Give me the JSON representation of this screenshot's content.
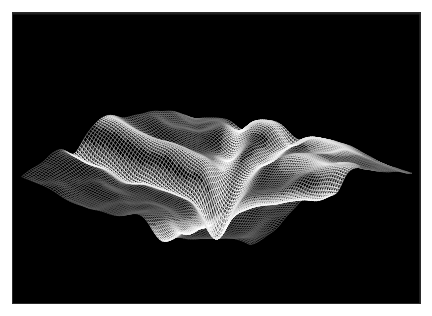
{
  "figure": {
    "type": "wireframe-surface-plot",
    "title": "",
    "background_color": "#000000",
    "page_color": "#ffffff",
    "line_color": "#d8d8d8",
    "border_width_px": 13,
    "plot_width_px": 407,
    "plot_height_px": 290
  },
  "chart_data": {
    "type": "surface",
    "render_style": "wireframe-mesh",
    "title": "",
    "subtitle": "",
    "xlabel": "",
    "ylabel": "",
    "zlabel": "",
    "grid": false,
    "legend": false,
    "axes_visible": false,
    "tick_labels": [],
    "annotations": [],
    "colors": {
      "background": "#000000",
      "wire_low": "#8d8d8d",
      "wire_high": "#f2f2f2",
      "wire_shadow": "#2f2f2f"
    },
    "projection": {
      "kind": "isometric-oblique",
      "azimuth_deg": 40,
      "elevation_deg": 26,
      "z_scale": 1.0
    },
    "grid_resolution": {
      "nx": 96,
      "ny": 96
    },
    "corner_points_px": {
      "left": [
        22,
        196
      ],
      "top": [
        196,
        82
      ],
      "right": [
        412,
        143
      ],
      "bottom": [
        250,
        248
      ]
    },
    "features": [
      {
        "name": "main-channel",
        "kind": "valley",
        "brightness": 1.0
      },
      {
        "name": "north-tributary",
        "kind": "valley",
        "brightness": 0.85
      },
      {
        "name": "east-channel",
        "kind": "valley",
        "brightness": 0.95
      },
      {
        "name": "left-ridge",
        "kind": "ridge",
        "brightness": 0.8
      },
      {
        "name": "right-ridge",
        "kind": "ridge",
        "brightness": 0.75
      },
      {
        "name": "back-peaks",
        "kind": "ridge",
        "brightness": 0.7
      }
    ],
    "terrain_model": {
      "seed": 20240517,
      "base_tilt": {
        "x": -0.22,
        "y": 0.16
      },
      "noise_octaves": [
        {
          "freq": 1.4,
          "amp": 0.42
        },
        {
          "freq": 3.1,
          "amp": 0.2
        },
        {
          "freq": 6.7,
          "amp": 0.1
        },
        {
          "freq": 13.3,
          "amp": 0.05
        }
      ],
      "rivers": [
        {
          "label": "main-channel",
          "points": [
            [
              0.47,
              0.04
            ],
            [
              0.49,
              0.2
            ],
            [
              0.5,
              0.36
            ],
            [
              0.52,
              0.5
            ],
            [
              0.55,
              0.62
            ],
            [
              0.58,
              0.74
            ],
            [
              0.6,
              0.88
            ],
            [
              0.61,
              1.0
            ]
          ],
          "width": 0.055,
          "depth": 0.3
        },
        {
          "label": "north-tributary",
          "points": [
            [
              0.22,
              0.02
            ],
            [
              0.29,
              0.14
            ],
            [
              0.36,
              0.27
            ],
            [
              0.44,
              0.4
            ],
            [
              0.5,
              0.5
            ]
          ],
          "width": 0.045,
          "depth": 0.22
        },
        {
          "label": "east-channel",
          "points": [
            [
              0.53,
              0.55
            ],
            [
              0.66,
              0.56
            ],
            [
              0.78,
              0.54
            ],
            [
              0.9,
              0.5
            ],
            [
              1.0,
              0.46
            ]
          ],
          "width": 0.05,
          "depth": 0.26
        },
        {
          "label": "west-trough",
          "points": [
            [
              0.0,
              0.7
            ],
            [
              0.12,
              0.66
            ],
            [
              0.26,
              0.62
            ],
            [
              0.38,
              0.58
            ],
            [
              0.48,
              0.54
            ]
          ],
          "width": 0.05,
          "depth": 0.24
        }
      ],
      "ridges": [
        {
          "label": "left-ridge",
          "points": [
            [
              0.0,
              0.52
            ],
            [
              0.14,
              0.49
            ],
            [
              0.28,
              0.46
            ],
            [
              0.4,
              0.44
            ]
          ],
          "width": 0.06,
          "height": 0.18
        },
        {
          "label": "right-ridge",
          "points": [
            [
              0.7,
              0.3
            ],
            [
              0.82,
              0.32
            ],
            [
              0.93,
              0.36
            ],
            [
              1.0,
              0.4
            ]
          ],
          "width": 0.07,
          "height": 0.2
        },
        {
          "label": "back-peaks",
          "points": [
            [
              0.3,
              0.06
            ],
            [
              0.46,
              0.02
            ],
            [
              0.62,
              0.05
            ],
            [
              0.76,
              0.12
            ]
          ],
          "width": 0.08,
          "height": 0.16
        }
      ]
    }
  }
}
